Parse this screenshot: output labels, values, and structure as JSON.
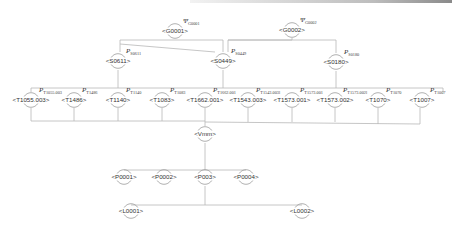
{
  "diagram": {
    "type": "tree",
    "colors": {
      "edge": "#b8b8b8",
      "node_arc": "#9c9c9c",
      "text": "#333333"
    },
    "nodes": [
      {
        "id": "G0001",
        "label": "<G0001>",
        "symbol": "Ψ",
        "sub": "G0001",
        "x": 175,
        "y": 31,
        "level": 0
      },
      {
        "id": "G0002",
        "label": "<G0002>",
        "symbol": "Ψ",
        "sub": "G0002",
        "x": 292,
        "y": 30,
        "level": 0
      },
      {
        "id": "S0611",
        "label": "<S0611>",
        "symbol": "P",
        "sub": "S0611",
        "x": 118,
        "y": 61,
        "level": 1
      },
      {
        "id": "S0449",
        "label": "<S0449>",
        "symbol": "P",
        "sub": "S0449",
        "x": 223,
        "y": 61,
        "level": 1
      },
      {
        "id": "S0180",
        "label": "<S0180>",
        "symbol": "P",
        "sub": "S0180",
        "x": 336,
        "y": 62,
        "level": 1
      },
      {
        "id": "T1055.003",
        "label": "<T1055.003>",
        "symbol": "P",
        "sub": "T1055.003",
        "x": 31,
        "y": 100,
        "level": 2
      },
      {
        "id": "T1486",
        "label": "<T1486>",
        "symbol": "P",
        "sub": "T1486",
        "x": 74,
        "y": 100,
        "level": 2
      },
      {
        "id": "T1140",
        "label": "<T1140>",
        "symbol": "P",
        "sub": "T1140",
        "x": 118,
        "y": 100,
        "level": 2
      },
      {
        "id": "T1083",
        "label": "<T1083>",
        "symbol": "P",
        "sub": "T1083",
        "x": 162,
        "y": 100,
        "level": 2
      },
      {
        "id": "T1662.001",
        "label": "<T1662.001>",
        "symbol": "P",
        "sub": "T1662.001",
        "x": 205,
        "y": 100,
        "level": 2
      },
      {
        "id": "T1543.003",
        "label": "<T1543.003>",
        "symbol": "P",
        "sub": "T1543.003l",
        "x": 248,
        "y": 100,
        "level": 2
      },
      {
        "id": "T1573.001",
        "label": "<T1573.001>",
        "symbol": "P",
        "sub": "T1573.001",
        "x": 292,
        "y": 100,
        "level": 2
      },
      {
        "id": "T1573.002",
        "label": "<T1573.002>",
        "symbol": "P",
        "sub": "T1573.002l",
        "x": 335,
        "y": 100,
        "level": 2
      },
      {
        "id": "T1070",
        "label": "<T1070>",
        "symbol": "P",
        "sub": "T1070",
        "x": 378,
        "y": 100,
        "level": 2
      },
      {
        "id": "T1007",
        "label": "<T1007>",
        "symbol": "P",
        "sub": "T1007",
        "x": 422,
        "y": 100,
        "level": 2
      },
      {
        "id": "Vmm",
        "label": "<Vmm>",
        "x": 205,
        "y": 134,
        "level": 3
      },
      {
        "id": "P0001",
        "label": "<P0001>",
        "x": 124,
        "y": 177,
        "level": 4
      },
      {
        "id": "P0002",
        "label": "<P0002>",
        "x": 164,
        "y": 177,
        "level": 4
      },
      {
        "id": "P003",
        "label": "<P003>",
        "x": 205,
        "y": 177,
        "level": 4
      },
      {
        "id": "P0004",
        "label": "<P0004>",
        "x": 246,
        "y": 177,
        "level": 4
      },
      {
        "id": "L0001",
        "label": "<L0001>",
        "x": 131,
        "y": 211,
        "level": 5
      },
      {
        "id": "L0002",
        "label": "<L0002>",
        "x": 302,
        "y": 211,
        "level": 5
      }
    ],
    "edges": [
      {
        "points": [
          [
            175,
            40
          ],
          [
            175,
            40
          ]
        ]
      },
      {
        "points": [
          [
            120,
            52
          ],
          [
            120,
            40
          ],
          [
            223,
            40
          ],
          [
            223,
            52
          ]
        ]
      },
      {
        "points": [
          [
            228,
            52
          ],
          [
            228,
            40
          ],
          [
            336,
            40
          ],
          [
            336,
            53
          ]
        ]
      },
      {
        "points": [
          [
            228,
            40
          ],
          [
            292,
            40
          ],
          [
            292,
            38
          ]
        ]
      },
      {
        "points": [
          [
            120,
            44
          ],
          [
            215,
            52
          ]
        ]
      },
      {
        "points": [
          [
            118,
            70
          ],
          [
            118,
            88
          ]
        ]
      },
      {
        "points": [
          [
            223,
            70
          ],
          [
            223,
            88
          ]
        ]
      },
      {
        "points": [
          [
            336,
            71
          ],
          [
            336,
            88
          ]
        ]
      },
      {
        "points": [
          [
            31,
            92
          ],
          [
            31,
            88
          ],
          [
            443,
            88
          ],
          [
            443,
            92
          ]
        ]
      },
      {
        "points": [
          [
            31,
            108
          ],
          [
            31,
            121
          ],
          [
            205,
            121
          ],
          [
            205,
            126
          ]
        ]
      },
      {
        "points": [
          [
            74,
            108
          ],
          [
            74,
            121
          ]
        ]
      },
      {
        "points": [
          [
            118,
            108
          ],
          [
            118,
            121
          ]
        ]
      },
      {
        "points": [
          [
            162,
            108
          ],
          [
            162,
            121
          ]
        ]
      },
      {
        "points": [
          [
            205,
            108
          ],
          [
            205,
            121
          ]
        ]
      },
      {
        "points": [
          [
            248,
            108
          ],
          [
            248,
            122
          ]
        ]
      },
      {
        "points": [
          [
            292,
            108
          ],
          [
            292,
            122
          ]
        ]
      },
      {
        "points": [
          [
            335,
            108
          ],
          [
            335,
            122
          ]
        ]
      },
      {
        "points": [
          [
            378,
            108
          ],
          [
            378,
            124
          ]
        ]
      },
      {
        "points": [
          [
            420,
            108
          ],
          [
            420,
            124
          ]
        ]
      },
      {
        "points": [
          [
            205,
            122
          ],
          [
            420,
            124
          ]
        ]
      },
      {
        "points": [
          [
            205,
            143
          ],
          [
            205,
            170
          ]
        ]
      },
      {
        "points": [
          [
            124,
            170
          ],
          [
            246,
            170
          ]
        ]
      },
      {
        "points": [
          [
            205,
            186
          ],
          [
            205,
            205
          ]
        ]
      },
      {
        "points": [
          [
            131,
            205
          ],
          [
            302,
            205
          ]
        ]
      }
    ]
  }
}
